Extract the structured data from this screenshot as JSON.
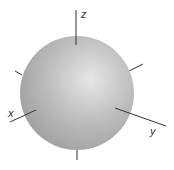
{
  "diagram": {
    "type": "3d-sphere-with-axes",
    "sphere": {
      "center": [
        77,
        93
      ],
      "radius": 57,
      "color_highlight": "#e6e6e6",
      "color_mid": "#b9b9b9",
      "color_edge": "#9a9a9a"
    },
    "axis_color": "#333333",
    "axes": [
      {
        "name": "z",
        "label": "z",
        "line": [
          76,
          10,
          76,
          45
        ],
        "label_pos": [
          81,
          18
        ]
      },
      {
        "name": "x",
        "label": "x",
        "line": [
          10,
          122,
          36,
          110
        ],
        "label_pos": [
          8,
          117
        ]
      },
      {
        "name": "y",
        "label": "y",
        "line": [
          115,
          108,
          166,
          126
        ],
        "label_pos": [
          150,
          135
        ]
      }
    ],
    "stubs": [
      {
        "name": "negative-x-stub",
        "line": [
          127,
          72,
          143,
          64
        ]
      },
      {
        "name": "negative-y-stub",
        "line": [
          15,
          71,
          22,
          75
        ]
      },
      {
        "name": "negative-z-stub",
        "line": [
          77,
          150,
          77,
          160
        ]
      }
    ]
  }
}
